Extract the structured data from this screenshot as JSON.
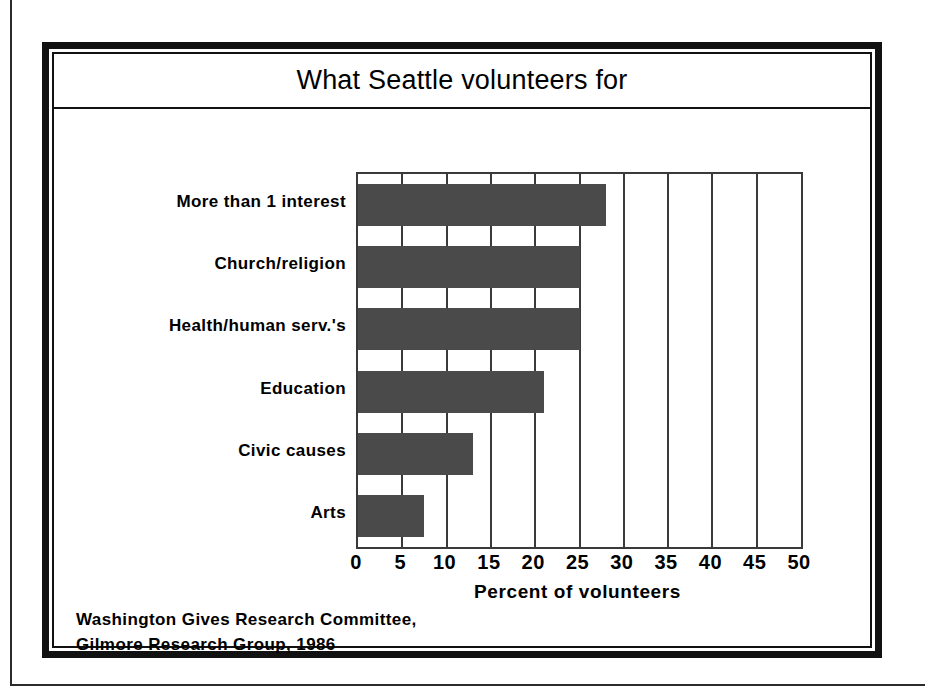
{
  "chart_data": {
    "type": "bar",
    "orientation": "horizontal",
    "title": "What Seattle volunteers for",
    "xlabel": "Percent of volunteers",
    "ylabel": "",
    "categories": [
      "More than 1 interest",
      "Church/religion",
      "Health/human serv.'s",
      "Education",
      "Civic causes",
      "Arts"
    ],
    "values": [
      28,
      25,
      25,
      21,
      13,
      7.5
    ],
    "xlim": [
      0,
      50
    ],
    "xticks": [
      0,
      5,
      10,
      15,
      20,
      25,
      30,
      35,
      40,
      45,
      50
    ],
    "xtick_labels": [
      "0",
      "5",
      "10",
      "15",
      "20",
      "25",
      "30",
      "35",
      "40",
      "45",
      "50"
    ],
    "grid": "vertical",
    "legend": "none",
    "bar_color": "#4a4a4a",
    "axis_color": "#3a3a3a",
    "background_color": "#ffffff"
  },
  "source_note": {
    "line1": "Washington Gives Research Committee,",
    "line2": "Gilmore Research Group, 1986"
  }
}
